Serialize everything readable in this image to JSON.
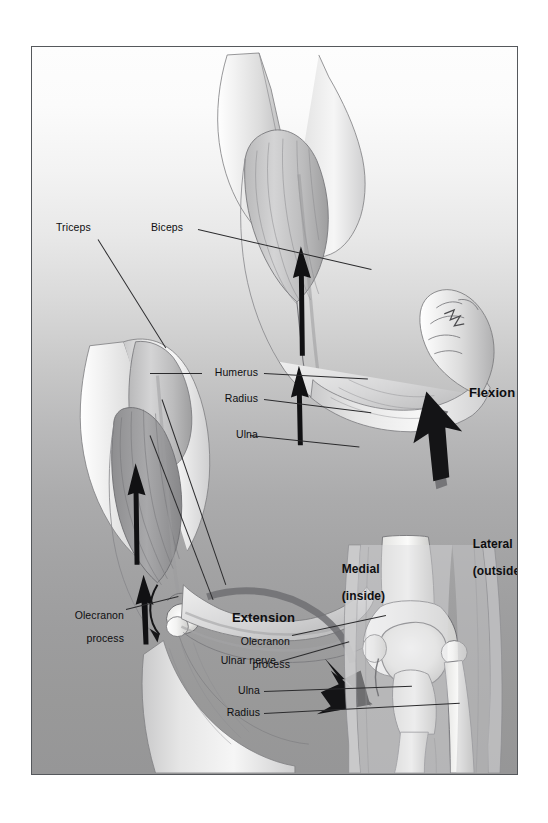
{
  "figure": {
    "frame_color": "#55585c",
    "background_top": "#fdfdfd",
    "background_bottom": "#969697",
    "ink_color": "#0e0e10"
  },
  "labels": {
    "triceps": "Triceps",
    "biceps": "Biceps",
    "humerus": "Humerus",
    "radius": "Radius",
    "ulna": "Ulna",
    "olecranon_line1": "Olecranon",
    "olecranon_line2": "process",
    "flexion": "Flexion",
    "extension": "Extension"
  },
  "detail_view": {
    "medial_line1": "Medial",
    "medial_line2": "(inside)",
    "lateral_line1": "Lateral",
    "lateral_line2": "(outside)",
    "olecranon_line1": "Olecranon",
    "olecranon_line2": "process",
    "ulnar_nerve": "Ulnar nerve",
    "ulna": "Ulna",
    "radius": "Radius"
  }
}
